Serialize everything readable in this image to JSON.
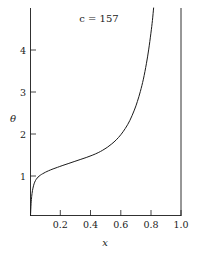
{
  "chart_data": {
    "type": "line",
    "title": "c = 157",
    "xlabel": "x",
    "ylabel": "θ",
    "xlim": [
      0.0,
      1.0
    ],
    "ylim": [
      0.0,
      5.1
    ],
    "grid": false,
    "legend": "none",
    "xticks": [
      0.2,
      0.4,
      0.6,
      0.8,
      1.0
    ],
    "xtick_labels": [
      "0.2",
      "0.4",
      "0.6",
      "0.8",
      "1.0"
    ],
    "yticks": [
      1,
      2,
      3,
      4
    ],
    "ytick_labels": [
      "1",
      "2",
      "3",
      "4"
    ],
    "series": [
      {
        "name": "theta(x)",
        "color": "#1a1a1a",
        "x": [
          0.0,
          0.004,
          0.008,
          0.013,
          0.02,
          0.028,
          0.038,
          0.05,
          0.065,
          0.08,
          0.1,
          0.12,
          0.15,
          0.18,
          0.21,
          0.25,
          0.29,
          0.33,
          0.37,
          0.41,
          0.45,
          0.48,
          0.51,
          0.54,
          0.57,
          0.6,
          0.63,
          0.66,
          0.69,
          0.71,
          0.73,
          0.75,
          0.77,
          0.785,
          0.8,
          0.81,
          0.818
        ],
        "y": [
          0.0,
          0.3,
          0.47,
          0.61,
          0.73,
          0.82,
          0.89,
          0.945,
          0.99,
          1.025,
          1.065,
          1.1,
          1.145,
          1.185,
          1.225,
          1.275,
          1.325,
          1.375,
          1.425,
          1.48,
          1.545,
          1.605,
          1.675,
          1.76,
          1.86,
          1.985,
          2.14,
          2.335,
          2.59,
          2.8,
          3.05,
          3.35,
          3.73,
          4.07,
          4.48,
          4.79,
          5.1
        ]
      }
    ]
  },
  "axes": {
    "title_text": "c = 157",
    "x_axis_label": "x",
    "y_axis_label": "θ"
  }
}
